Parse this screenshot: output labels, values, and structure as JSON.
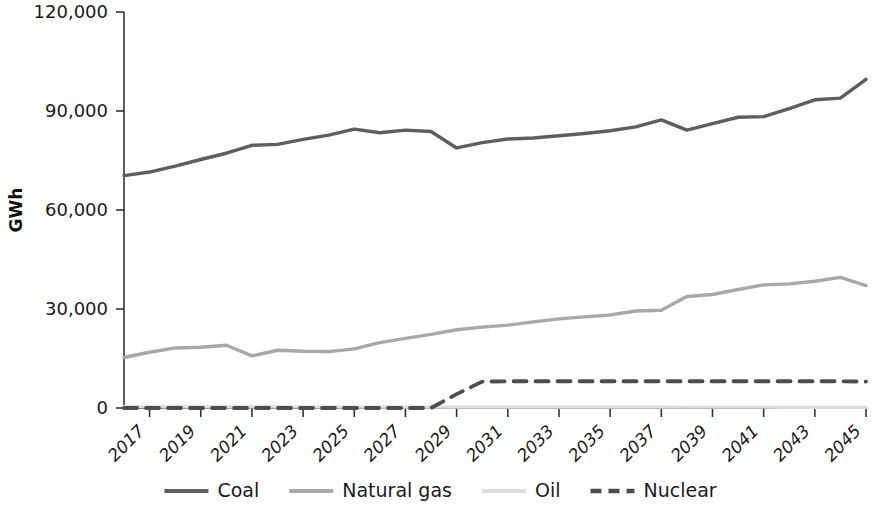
{
  "chart_data": {
    "type": "line",
    "title": "",
    "xlabel": "",
    "ylabel": "GWh",
    "ylim": [
      0,
      120000
    ],
    "ytick_values": [
      0,
      30000,
      60000,
      90000,
      120000
    ],
    "ytick_labels": [
      "0",
      "30,000",
      "60,000",
      "90,000",
      "120,000"
    ],
    "grid": false,
    "legend_position": "bottom",
    "x": [
      2016,
      2017,
      2018,
      2019,
      2020,
      2021,
      2022,
      2023,
      2024,
      2025,
      2026,
      2027,
      2028,
      2029,
      2030,
      2031,
      2032,
      2033,
      2034,
      2035,
      2036,
      2037,
      2038,
      2039,
      2040,
      2041,
      2042,
      2043,
      2044,
      2045
    ],
    "xtick_labels": [
      "2017",
      "2019",
      "2021",
      "2023",
      "2025",
      "2027",
      "2029",
      "2031",
      "2033",
      "2035",
      "2037",
      "2039",
      "2041",
      "2043",
      "2045"
    ],
    "xtick_values": [
      2017,
      2019,
      2021,
      2023,
      2025,
      2027,
      2029,
      2031,
      2033,
      2035,
      2037,
      2039,
      2041,
      2043,
      2045
    ],
    "series": [
      {
        "name": "Coal",
        "color": "#5e5e5e",
        "dash": "solid",
        "width": 3.4,
        "values": [
          70400,
          71500,
          73300,
          75300,
          77200,
          79600,
          79900,
          81400,
          82700,
          84500,
          83400,
          84200,
          83800,
          78800,
          80400,
          81500,
          81800,
          82500,
          83200,
          84000,
          85200,
          87300,
          84200,
          86200,
          88100,
          88300,
          90700,
          93400,
          93900,
          99600
        ]
      },
      {
        "name": "Natural gas",
        "color": "#a8a8a8",
        "dash": "solid",
        "width": 3.4,
        "values": [
          15300,
          16900,
          18200,
          18400,
          19000,
          15800,
          17500,
          17200,
          17100,
          17900,
          19800,
          21100,
          22300,
          23700,
          24500,
          25100,
          26100,
          27000,
          27600,
          28200,
          29400,
          29600,
          33800,
          34400,
          35900,
          37300,
          37600,
          38400,
          39600,
          37100
        ]
      },
      {
        "name": "Oil",
        "color": "#dcdcdc",
        "dash": "solid",
        "width": 3.2,
        "values": [
          400,
          380,
          360,
          350,
          340,
          330,
          320,
          310,
          300,
          300,
          290,
          290,
          280,
          280,
          270,
          270,
          260,
          260,
          250,
          250,
          240,
          240,
          230,
          230,
          220,
          220,
          210,
          210,
          200,
          200
        ]
      },
      {
        "name": "Nuclear",
        "color": "#4d4d4d",
        "dash": "dashed",
        "width": 3.8,
        "values": [
          0,
          0,
          0,
          0,
          0,
          0,
          0,
          0,
          0,
          0,
          0,
          0,
          0,
          4200,
          8000,
          8100,
          8100,
          8100,
          8100,
          8100,
          8100,
          8100,
          8100,
          8100,
          8100,
          8100,
          8100,
          8100,
          8100,
          8000
        ]
      }
    ]
  },
  "legend": {
    "items": [
      {
        "label": "Coal",
        "swatch": "coal-swatch"
      },
      {
        "label": "Natural gas",
        "swatch": "natural-gas-swatch"
      },
      {
        "label": "Oil",
        "swatch": "oil-swatch"
      },
      {
        "label": "Nuclear",
        "swatch": "nuclear-swatch"
      }
    ]
  }
}
